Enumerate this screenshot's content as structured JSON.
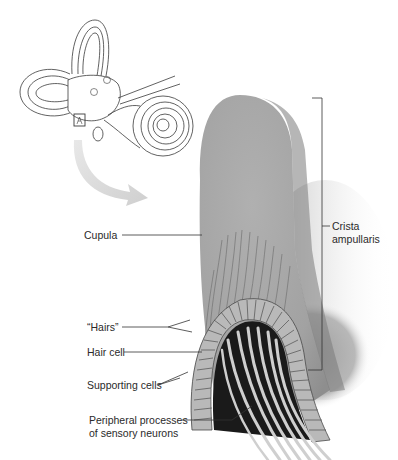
{
  "figure": {
    "inset": {
      "name": "inner-ear-overview",
      "marker": "ampulla-box"
    },
    "labels": {
      "cupula": "Cupula",
      "hairs": "“Hairs”",
      "hair_cell": "Hair cell",
      "supporting_cells": "Supporting cells",
      "peripheral_line1": "Peripheral processes",
      "peripheral_line2": "of sensory neurons",
      "crista_line1": "Crista",
      "crista_line2": "ampullaris"
    },
    "colors": {
      "cupula": "#a9a9a9",
      "cupula_shadow": "#8a8a8a",
      "tissue": "#9c9c9c",
      "neuron": "#c8c8c8",
      "dark": "#1a1a1a",
      "line": "#333333",
      "arrow": "#d6d6d6"
    }
  }
}
